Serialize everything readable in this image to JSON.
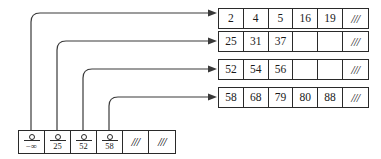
{
  "diagram": {
    "hatch_symbol": "///",
    "pointer_symbol": "○"
  },
  "leaf_nodes": [
    {
      "id": "leaf-1",
      "cells": [
        "2",
        "4",
        "5",
        "16",
        "19"
      ],
      "trailing": "///"
    },
    {
      "id": "leaf-2",
      "cells": [
        "25",
        "31",
        "37",
        "",
        ""
      ],
      "trailing": "///"
    },
    {
      "id": "leaf-3",
      "cells": [
        "52",
        "54",
        "56",
        "",
        ""
      ],
      "trailing": "///"
    },
    {
      "id": "leaf-4",
      "cells": [
        "58",
        "68",
        "79",
        "80",
        "88"
      ],
      "trailing": "///"
    }
  ],
  "index_node": {
    "id": "index-node",
    "entries": [
      {
        "pointer": "○",
        "key": "−∞",
        "type": "key"
      },
      {
        "pointer": "○",
        "key": "25",
        "type": "key"
      },
      {
        "pointer": "○",
        "key": "52",
        "type": "key"
      },
      {
        "pointer": "○",
        "key": "58",
        "type": "key"
      },
      {
        "pointer": "",
        "key": "///",
        "type": "hatch"
      },
      {
        "pointer": "",
        "key": "///",
        "type": "hatch"
      }
    ]
  },
  "connectors": [
    {
      "id": "connector-1",
      "from_entry": "−∞",
      "to_leaf": "leaf-1"
    },
    {
      "id": "connector-2",
      "from_entry": "25",
      "to_leaf": "leaf-2"
    },
    {
      "id": "connector-3",
      "from_entry": "52",
      "to_leaf": "leaf-3"
    },
    {
      "id": "connector-4",
      "from_entry": "58",
      "to_leaf": "leaf-4"
    }
  ],
  "colors": {
    "stroke": "#2a2a2a",
    "connector": "#3a3a3a",
    "background": "#ffffff",
    "text": "#1a1a1a"
  }
}
